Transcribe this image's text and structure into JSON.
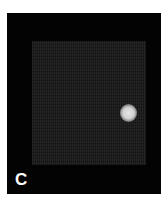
{
  "figure": {
    "panel_label": "C",
    "colors": {
      "background": "#030303",
      "grid_field": "#1a1a1a",
      "spot": "#e0e0e0",
      "label": "#ffffff"
    }
  }
}
